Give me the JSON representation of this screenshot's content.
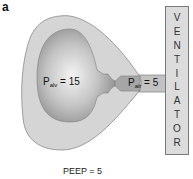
{
  "panel": {
    "label": "a"
  },
  "alveolus": {
    "pressure_symbol": "P",
    "pressure_subscript": "alv",
    "pressure_value_text": " = 15",
    "pressure_value": 15
  },
  "airway": {
    "pressure_symbol": "P",
    "pressure_subscript": "air",
    "pressure_value_text": " = 5",
    "pressure_value": 5
  },
  "ventilator": {
    "label": "VENTILATOR",
    "letters": [
      "V",
      "E",
      "N",
      "T",
      "I",
      "L",
      "A",
      "T",
      "O",
      "R"
    ]
  },
  "peep": {
    "label": "PEEP = 5",
    "value": 5
  },
  "colors": {
    "outer_shape": "#d5d5d5",
    "outer_border": "#8a8a8a",
    "inner_bulb_light": "#f2f2f2",
    "inner_bulb_dark": "#8f8f8f",
    "airway_tube": "#a8a8a8",
    "ventilator_box": "#dcdcdc"
  }
}
